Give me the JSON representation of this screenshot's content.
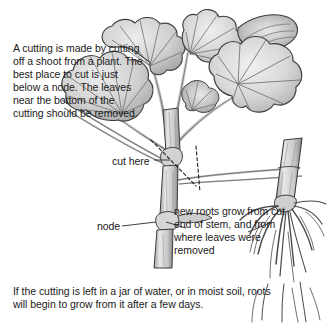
{
  "page": {
    "background_color": "#ffffff",
    "text_color": "#1a1a1a"
  },
  "illustration": {
    "name": "geranium-cutting-illustration",
    "style": "grayscale-pencil-drawing",
    "parts": [
      "leaves",
      "stem",
      "node",
      "cut-lines",
      "rooted-cutting",
      "roots"
    ],
    "colors": {
      "outline": "#3a3a3a",
      "leaf_light": "#e6e6e6",
      "leaf_mid": "#c8c8c8",
      "leaf_dark": "#9a9a9a",
      "stem_light": "#e2e2e2",
      "stem_mid": "#b8b8b8",
      "stem_dark": "#8a8a8a",
      "root": "#5a5a5a",
      "vein": "#6e6e6e",
      "dashed_cut": "#2a2a2a"
    }
  },
  "text": {
    "intro": "A cutting is made by cutting off a shoot from a plant. The best place to cut is just below a node. The leaves near the bottom of the cutting should be removed.",
    "cut_here_label": "cut here",
    "node_label": "node",
    "roots_note": "new roots grow from cut end of stem, and from where leaves were removed",
    "bottom_note": "If the cutting is left in a jar of water, or in moist soil, roots will begin to grow from it after a few days."
  }
}
